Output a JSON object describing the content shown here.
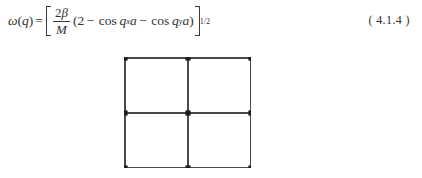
{
  "page": {
    "background_color": "#ffffff",
    "text_color": "#333333"
  },
  "equation": {
    "label": "(  4.1.4  )",
    "lhs_omega": "ω",
    "lhs_open_paren": "(",
    "lhs_var": "q",
    "lhs_close_paren": ")",
    "relation": "=",
    "fraction_numerator_coeff": "2",
    "fraction_numerator_symbol": "β",
    "fraction_denominator": "M",
    "group_open": "(",
    "term_constant": "2",
    "minus_1": "−",
    "cos_1": "cos",
    "cos_1_var": "q",
    "cos_1_sub": "x",
    "cos_1_lattice": "a",
    "minus_2": "−",
    "cos_2": "cos",
    "cos_2_var": "q",
    "cos_2_sub": "y",
    "cos_2_lattice": "a",
    "group_close": ")",
    "exponent": "1/2",
    "plain_text": "ω(q) = [ 2β/M (2 − cos q_x a − cos q_y a) ]^(1/2)"
  },
  "lattice": {
    "description": "two-dimensional square lattice, 2 by 2 cells",
    "rows": 2,
    "cols": 2,
    "node_count": 9,
    "line_color": "#4a4a4a",
    "node_color": "#1c1c1c",
    "cell_width": 63,
    "cell_height": 55,
    "line_width": 1.6,
    "node_radius": 2.6,
    "nodes": [
      {
        "x": 0,
        "y": 0
      },
      {
        "x": 63,
        "y": 0
      },
      {
        "x": 126,
        "y": 0
      },
      {
        "x": 0,
        "y": 55
      },
      {
        "x": 63,
        "y": 55
      },
      {
        "x": 126,
        "y": 55
      },
      {
        "x": 0,
        "y": 110
      },
      {
        "x": 63,
        "y": 110
      },
      {
        "x": 126,
        "y": 110
      }
    ],
    "horizontal_lines_y": [
      0,
      55,
      110
    ],
    "vertical_lines_x": [
      0,
      63,
      126
    ]
  }
}
